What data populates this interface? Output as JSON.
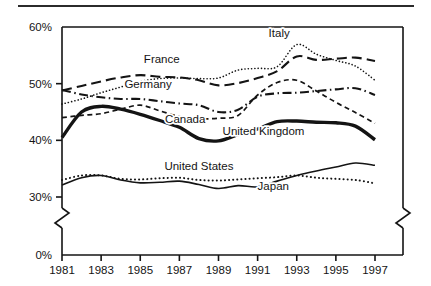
{
  "figure": {
    "top_rule": true,
    "background": "#ffffff",
    "ink_color": "#141414"
  },
  "chart_data": {
    "type": "line",
    "title": "",
    "xlabel": "",
    "ylabel": "",
    "xlim": [
      1981,
      1997
    ],
    "ylim": [
      28,
      60
    ],
    "ylim_display": [
      0,
      60
    ],
    "axis_break": {
      "present": true,
      "between": [
        0,
        28
      ],
      "note": "zig-zag break on y-axis between 0% and the 30% region"
    },
    "grid": false,
    "legend": "inline-labels",
    "x": [
      1981,
      1982,
      1983,
      1984,
      1985,
      1986,
      1987,
      1988,
      1989,
      1990,
      1991,
      1992,
      1993,
      1994,
      1995,
      1996,
      1997
    ],
    "xticks": [
      1981,
      1983,
      1985,
      1987,
      1989,
      1991,
      1993,
      1995,
      1997
    ],
    "xticklabels": [
      "1981",
      "1983",
      "1985",
      "1987",
      "1989",
      "1991",
      "1993",
      "1995",
      "1997"
    ],
    "yticks": [
      0,
      30,
      40,
      50,
      60
    ],
    "yticklabels": [
      "0%",
      "30%",
      "40%",
      "50%",
      "60%"
    ],
    "series": [
      {
        "name": "Italy",
        "style": "dotted",
        "width": 1.6,
        "label_x": 1992.1,
        "label_y": 58.2,
        "values": [
          46.4,
          47.3,
          48.4,
          49.4,
          50.4,
          50.9,
          51.0,
          50.9,
          51.0,
          52.4,
          52.7,
          53.0,
          56.9,
          55.2,
          54.1,
          53.1,
          50.6
        ]
      },
      {
        "name": "France",
        "style": "long-dash",
        "width": 2.1,
        "label_x": 1986.1,
        "label_y": 53.6,
        "values": [
          48.8,
          49.6,
          50.4,
          51.1,
          51.5,
          51.2,
          51.1,
          50.6,
          49.7,
          50.1,
          51.0,
          52.2,
          54.8,
          54.2,
          54.4,
          54.6,
          54.0
        ]
      },
      {
        "name": "Germany",
        "style": "dash-dot",
        "width": 2.1,
        "label_x": 1985.4,
        "label_y": 49.2,
        "values": [
          48.9,
          48.1,
          47.6,
          47.3,
          47.3,
          46.9,
          46.5,
          46.2,
          45.0,
          45.4,
          47.7,
          48.3,
          48.4,
          48.7,
          49.0,
          49.2,
          48.0
        ]
      },
      {
        "name": "Canada",
        "style": "short-dash",
        "width": 1.7,
        "label_x": 1987.3,
        "label_y": 43.0,
        "values": [
          44.0,
          44.4,
          44.7,
          45.5,
          46.2,
          45.2,
          44.2,
          43.8,
          43.9,
          44.4,
          48.0,
          50.2,
          50.6,
          48.7,
          46.7,
          44.9,
          43.0
        ]
      },
      {
        "name": "United Kingdom",
        "style": "thick-solid",
        "width": 3.4,
        "label_x": 1991.3,
        "label_y": 41.0,
        "values": [
          40.5,
          45.0,
          46.0,
          45.5,
          44.6,
          43.5,
          42.3,
          40.3,
          39.9,
          41.0,
          42.0,
          43.3,
          43.4,
          43.2,
          43.1,
          42.5,
          40.1
        ]
      },
      {
        "name": "United States",
        "style": "dotted",
        "width": 2.0,
        "label_x": 1988.0,
        "label_y": 34.7,
        "values": [
          33.0,
          33.8,
          33.8,
          33.2,
          33.1,
          33.3,
          33.4,
          33.0,
          32.9,
          33.1,
          33.3,
          33.5,
          33.8,
          33.4,
          33.2,
          33.0,
          32.4
        ]
      },
      {
        "name": "Japan",
        "style": "thin-solid",
        "width": 1.6,
        "label_x": 1991.8,
        "label_y": 31.2,
        "values": [
          32.1,
          33.4,
          33.8,
          33.0,
          32.5,
          32.6,
          32.8,
          32.2,
          31.5,
          32.0,
          31.8,
          32.8,
          33.8,
          34.6,
          35.3,
          36.0,
          35.6
        ]
      }
    ]
  }
}
